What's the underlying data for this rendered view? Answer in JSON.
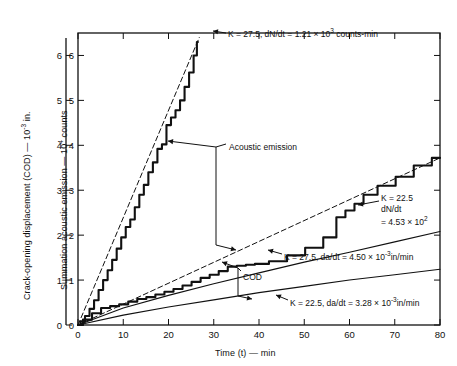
{
  "chart_data": {
    "type": "line",
    "title": "",
    "xlabel": "Time (t) — min",
    "ylabel_left": "Crack-opening displacement (COD) — 10⁻³ in.",
    "ylabel_inner": "Summation acoustic emission — 10⁴ counts",
    "xlim": [
      0,
      80
    ],
    "ylim": [
      0,
      6.5
    ],
    "xticks": [
      0,
      10,
      20,
      30,
      40,
      50,
      60,
      70,
      80
    ],
    "yticks": [
      0,
      1,
      2,
      3,
      4,
      5,
      6
    ],
    "grid": false,
    "legend_position": "none",
    "series": [
      {
        "name": "Acoustic emission, K = 27.5",
        "axis": "inner",
        "style": "stepped-solid",
        "x": [
          0,
          1,
          2,
          3,
          4,
          5,
          6,
          7,
          8,
          9,
          10,
          11,
          12,
          13,
          14,
          15,
          16,
          17,
          18,
          19,
          20,
          21,
          22,
          23,
          24,
          25,
          26,
          26.5
        ],
        "y": [
          0,
          0.08,
          0.2,
          0.36,
          0.55,
          0.78,
          1.0,
          1.22,
          1.45,
          1.7,
          1.95,
          2.18,
          2.35,
          2.62,
          2.9,
          3.12,
          3.4,
          3.62,
          3.92,
          4.02,
          4.45,
          4.62,
          4.78,
          5.0,
          5.3,
          5.62,
          6.0,
          6.3
        ]
      },
      {
        "name": "Acoustic emission fit, K = 27.5, dN/dt = 1.21 × 10³ counts-min",
        "axis": "inner",
        "style": "dashed-fit",
        "x": [
          0,
          26.8
        ],
        "y": [
          0,
          6.4
        ]
      },
      {
        "name": "Acoustic emission, K = 22.5",
        "axis": "inner",
        "style": "stepped-solid",
        "x": [
          0,
          2,
          4,
          6,
          8,
          10,
          12,
          14,
          16,
          18,
          20,
          22,
          24,
          26,
          28,
          30,
          32,
          34,
          36,
          38,
          40,
          44,
          48,
          52,
          56,
          58,
          60,
          62,
          64,
          68,
          72,
          76,
          80
        ],
        "y": [
          0,
          0.12,
          0.26,
          0.38,
          0.42,
          0.46,
          0.52,
          0.58,
          0.62,
          0.68,
          0.74,
          0.8,
          0.88,
          0.96,
          1.05,
          1.12,
          1.2,
          1.3,
          1.32,
          1.34,
          1.36,
          1.42,
          1.55,
          1.72,
          1.95,
          2.4,
          2.55,
          2.7,
          2.9,
          3.1,
          3.3,
          3.55,
          3.72
        ]
      },
      {
        "name": "Acoustic emission fit, K = 22.5, dN/dt = 4.53 × 10²",
        "axis": "inner",
        "style": "dashed-fit",
        "x": [
          0,
          80
        ],
        "y": [
          0,
          3.72
        ]
      },
      {
        "name": "COD, K = 27.5, da/dt = 4.50 × 10⁻³ in/min",
        "axis": "left",
        "style": "solid",
        "x": [
          0,
          10,
          20,
          30,
          40,
          50,
          60,
          70,
          80
        ],
        "y": [
          0,
          0.38,
          0.66,
          0.92,
          1.16,
          1.4,
          1.62,
          1.85,
          2.08
        ]
      },
      {
        "name": "COD, K = 22.5, da/dt = 3.28 × 10⁻³ in/min",
        "axis": "left",
        "style": "solid",
        "x": [
          0,
          10,
          20,
          30,
          40,
          50,
          60,
          70,
          80
        ],
        "y": [
          0,
          0.22,
          0.4,
          0.56,
          0.72,
          0.86,
          1.0,
          1.12,
          1.24
        ]
      }
    ],
    "annotations": [
      {
        "name": "ae-high-rate-label",
        "text": "K = 27.5, dN/dt = 1.21 × 10",
        "sup": "3",
        "tail": " counts-min"
      },
      {
        "name": "ae-low-rate-label",
        "line1": "K = 22.5",
        "line2": "dN/dt",
        "line3": "= 4.53 × 10",
        "line3_sup": "2"
      },
      {
        "name": "cod-high-rate-label",
        "text": "K = 27.5, da/dt = 4.50 × 10",
        "sup": "-3",
        "tail": "in/min"
      },
      {
        "name": "cod-low-rate-label",
        "text": "K = 22.5, da/dt = 3.28 × 10",
        "sup": "-3",
        "tail": "in/min"
      },
      {
        "name": "acoustic-emission-label",
        "text": "Acoustic emission"
      },
      {
        "name": "cod-label",
        "text": "COD"
      }
    ]
  },
  "axes": {
    "x_title": "Time (t) — min",
    "x_ticks": [
      "0",
      "10",
      "20",
      "30",
      "40",
      "50",
      "60",
      "70",
      "80"
    ],
    "y_ticks": [
      "0",
      "1",
      "2",
      "3",
      "4",
      "5",
      "6"
    ],
    "left_title_a": "Crack-opening displacement (COD) — 10",
    "left_title_sup": "-3",
    "left_title_b": " in.",
    "inner_title_a": "Summation acoustic emission — 10",
    "inner_title_sup": "4",
    "inner_title_b": " counts"
  },
  "labels": {
    "acoustic_emission": "Acoustic emission",
    "cod": "COD",
    "ae_high_pre": "K = 27.5, dN/dt = 1.21 × 10",
    "ae_high_sup": "3",
    "ae_high_post": " counts-min",
    "ae_low_l1": "K = 22.5",
    "ae_low_l2": "dN/dt",
    "ae_low_l3": "= 4.53 × 10",
    "ae_low_l3_sup": "2",
    "cod_high_pre": "K = 27.5, da/dt = 4.50 × 10",
    "cod_high_sup": "-3",
    "cod_high_post": "in/min",
    "cod_low_pre": "K = 22.5, da/dt = 3.28 × 10",
    "cod_low_sup": "-3",
    "cod_low_post": "in/min"
  }
}
